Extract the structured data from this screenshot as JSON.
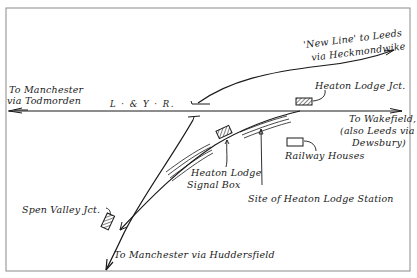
{
  "diagram": {
    "colors": {
      "ink": "#1a1a1a",
      "paper": "#ffffff",
      "frame": "#8a8a8a"
    },
    "labels": {
      "new_line_1": "'New Line' to Leeds",
      "new_line_2": "via Heckmondwike",
      "manchester_todmorden_1": "To Manchester",
      "manchester_todmorden_2": "via Todmorden",
      "lyr": "L · & Y · R.",
      "heaton_lodge_jct": "Heaton Lodge Jct.",
      "wakefield_1": "To Wakefield,",
      "wakefield_2": "(also Leeds via",
      "wakefield_3": "Dewsbury)",
      "railway_houses": "Railway Houses",
      "signal_box_1": "Heaton Lodge",
      "signal_box_2": "Signal Box",
      "station_site": "Site of Heaton Lodge Station",
      "spen_valley_jct": "Spen Valley Jct.",
      "manchester_huddersfield": "To Manchester via Huddersfield"
    },
    "nodes": [
      {
        "id": "heaton_lodge_jct_box",
        "type": "signal-box"
      },
      {
        "id": "heaton_lodge_signal_box",
        "type": "signal-box"
      },
      {
        "id": "spen_valley_jct_box",
        "type": "signal-box"
      },
      {
        "id": "railway_houses",
        "type": "building"
      },
      {
        "id": "heaton_lodge_station_site",
        "type": "platforms"
      }
    ]
  }
}
